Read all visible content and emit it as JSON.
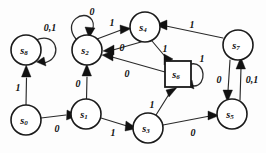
{
  "diagram": {
    "type": "state-transition-diagram",
    "colors": {
      "background": "#fdfdfd",
      "stroke": "#2a2a2a",
      "node_fill": "#ffffff",
      "text": "#111111"
    },
    "states": [
      {
        "id": "s0",
        "label": "s",
        "sub": "0",
        "shape": "circle",
        "cx": 26,
        "cy": 120,
        "r": 15
      },
      {
        "id": "s1",
        "label": "s",
        "sub": "1",
        "shape": "circle",
        "cx": 86,
        "cy": 114,
        "r": 15
      },
      {
        "id": "s2",
        "label": "s",
        "sub": "2",
        "shape": "circle",
        "cx": 87,
        "cy": 50,
        "r": 15
      },
      {
        "id": "s3",
        "label": "s",
        "sub": "3",
        "shape": "circle",
        "cx": 148,
        "cy": 128,
        "r": 15
      },
      {
        "id": "s4",
        "label": "s",
        "sub": "4",
        "shape": "circle",
        "cx": 145,
        "cy": 27,
        "r": 15
      },
      {
        "id": "s5",
        "label": "s",
        "sub": "5",
        "shape": "circle",
        "cx": 232,
        "cy": 114,
        "r": 15
      },
      {
        "id": "s6",
        "label": "s",
        "sub": "6",
        "shape": "square",
        "cx": 178,
        "cy": 74,
        "r": 13
      },
      {
        "id": "s7",
        "label": "s",
        "sub": "7",
        "shape": "circle",
        "cx": 238,
        "cy": 45,
        "r": 15
      },
      {
        "id": "s8",
        "label": "s",
        "sub": "8",
        "shape": "circle",
        "cx": 26,
        "cy": 50,
        "r": 15
      }
    ],
    "transitions": [
      {
        "id": "t-s0-s1",
        "from": "s0",
        "to": "s1",
        "label": "0",
        "label_x": 57,
        "label_y": 128
      },
      {
        "id": "t-s0-s8",
        "from": "s0",
        "to": "s8",
        "label": "1",
        "label_x": 18,
        "label_y": 87
      },
      {
        "id": "t-s8-s8",
        "from": "s8",
        "to": "s8",
        "label": "0,1",
        "label_x": 50,
        "label_y": 27
      },
      {
        "id": "t-s1-s2",
        "from": "s1",
        "to": "s2",
        "label": "0",
        "label_x": 78,
        "label_y": 83
      },
      {
        "id": "t-s1-s3",
        "from": "s1",
        "to": "s3",
        "label": "1",
        "label_x": 113,
        "label_y": 132
      },
      {
        "id": "t-s2-s2",
        "from": "s2",
        "to": "s2",
        "label": "0",
        "label_x": 92,
        "label_y": 11
      },
      {
        "id": "t-s2-s4",
        "from": "s2",
        "to": "s4",
        "label": "1",
        "label_x": 112,
        "label_y": 22
      },
      {
        "id": "t-s4-s2",
        "from": "s4",
        "to": "s2",
        "label": "0",
        "label_x": 122,
        "label_y": 47
      },
      {
        "id": "t-s4-s6",
        "from": "s4",
        "to": "s6",
        "label": "1",
        "label_x": 165,
        "label_y": 48
      },
      {
        "id": "t-s6-s2",
        "from": "s6",
        "to": "s2",
        "label": "0",
        "label_x": 127,
        "label_y": 73
      },
      {
        "id": "t-s6-s6",
        "from": "s6",
        "to": "s6",
        "label": "1",
        "label_x": 202,
        "label_y": 58
      },
      {
        "id": "t-s3-s6",
        "from": "s3",
        "to": "s6",
        "label": "1",
        "label_x": 152,
        "label_y": 104
      },
      {
        "id": "t-s3-s5",
        "from": "s3",
        "to": "s5",
        "label": "0",
        "label_x": 193,
        "label_y": 132
      },
      {
        "id": "t-s7-s4",
        "from": "s7",
        "to": "s4",
        "label": "1",
        "label_x": 192,
        "label_y": 24
      },
      {
        "id": "t-s7-s5",
        "from": "s7",
        "to": "s5",
        "label": "0",
        "label_x": 219,
        "label_y": 79
      },
      {
        "id": "t-s5-s7",
        "from": "s5",
        "to": "s7",
        "label": "0,1",
        "label_x": 250,
        "label_y": 79
      }
    ]
  }
}
